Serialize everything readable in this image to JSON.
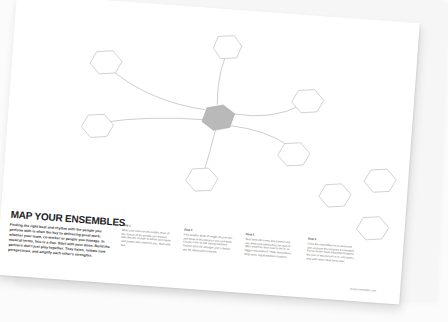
{
  "worksheet": {
    "title": "MAP YOUR ENSEMBLES",
    "intro": "Finding the right beat and rhythm with the people you perform with is often the key to delivering great work, whether your team, co-worker or people you manage. In musical terms, this is a duo. Start with your duos. Build the partners don't just play together. They listen, initiate new perspectives, and amplify each other's strengths.",
    "steps": [
      {
        "label": "Step 1",
        "text": "Write your name in the middle, then all the names of the people you interact with directly. People to whom you report and people who report to you. Start with two."
      },
      {
        "label": "Step 2",
        "text": "If it's helpful, think of length of each line and show in the distance you and them. Create a line to link strong relations. Thicker lines for stronger and a dotted one for attenuated relations."
      },
      {
        "label": "Step 3",
        "text": "Next look into every line partner and see what ensembles they are part of. Who would be they want to be in, or bigger ensembles? Think about them. Map more organizational relations."
      },
      {
        "label": "Step 4",
        "text": "Ones the ensembles is reconnected and evaluate the relations it consisted. Focus on the most influential relations the you or this person is in, and start a new with other. Map them next."
      }
    ],
    "footer_url": "mural.ensemble.com"
  },
  "diagram": {
    "center_fill": "#b9b9b9",
    "node_stroke": "#c8c8c8",
    "line_color": "#c4c4c4",
    "connected_nodes": 6,
    "extra_nodes": 3
  }
}
